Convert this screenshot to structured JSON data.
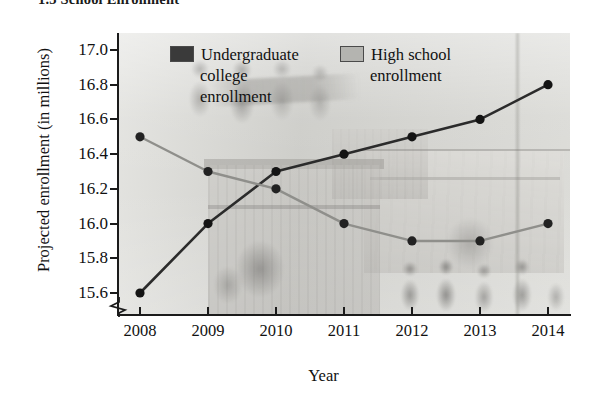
{
  "section": {
    "title": "1.3  School Enrollment"
  },
  "axis": {
    "y_title": "Projected enrollment (in millions)",
    "x_title": "Year",
    "y_ticks": [
      "17.0",
      "16.8",
      "16.6",
      "16.4",
      "16.2",
      "16.0",
      "15.8",
      "15.6"
    ],
    "x_ticks": [
      "2008",
      "2009",
      "2010",
      "2011",
      "2012",
      "2013",
      "2014"
    ],
    "broken_axis": true
  },
  "legend": {
    "items": [
      {
        "label_line1": "Undergraduate",
        "label_line2": "college",
        "label_line3": "enrollment",
        "color": "#3a3a3a"
      },
      {
        "label_line1": "High school",
        "label_line2": "enrollment",
        "label_line3": "",
        "color": "#b4b4b0"
      }
    ]
  },
  "chart_data": {
    "type": "line",
    "title": "1.3  School Enrollment",
    "xlabel": "Year",
    "ylabel": "Projected enrollment (in millions)",
    "categories": [
      "2008",
      "2009",
      "2010",
      "2011",
      "2012",
      "2013",
      "2014"
    ],
    "x": [
      2008,
      2009,
      2010,
      2011,
      2012,
      2013,
      2014
    ],
    "ylim": [
      15.5,
      17.0
    ],
    "xlim": [
      2008,
      2014
    ],
    "yticks": [
      15.6,
      15.8,
      16.0,
      16.2,
      16.4,
      16.6,
      16.8,
      17.0
    ],
    "grid": false,
    "legend_position": "top-center-inside",
    "axis_break_y": true,
    "series": [
      {
        "name": "Undergraduate college enrollment",
        "color": "#2b2b2b",
        "values": [
          15.6,
          16.0,
          16.3,
          16.4,
          16.5,
          16.6,
          16.8
        ]
      },
      {
        "name": "High school enrollment",
        "color": "#8f8f8b",
        "values": [
          16.5,
          16.3,
          16.2,
          16.0,
          15.9,
          15.9,
          16.0
        ]
      }
    ]
  }
}
